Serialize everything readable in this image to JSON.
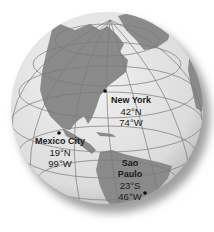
{
  "map": {
    "type": "orthographic globe",
    "colors": {
      "ocean": "#e4e4e4",
      "land": "#8a8a8a",
      "grid": "#7a7a7a",
      "shadow": "#9a9a9a",
      "text": "#1a1a1a"
    }
  },
  "cities": [
    {
      "name": "New York",
      "lat": "42°N",
      "lon": "74°W"
    },
    {
      "name": "Mexico City",
      "lat": "19°N",
      "lon": "99°W"
    },
    {
      "name": "Sao",
      "name2": "Paulo",
      "lat": "23°S",
      "lon": "46°W"
    }
  ]
}
